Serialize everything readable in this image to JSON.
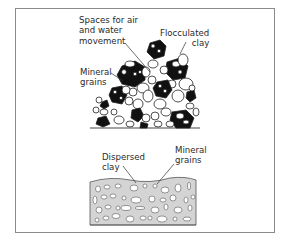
{
  "figure": {
    "flocculated": {
      "labels": {
        "spaces": "Spaces for air\nand water\nmovement",
        "flocculated_clay": "Flocculated\nclay",
        "mineral_grains": "Mineral\ngrains"
      }
    },
    "dispersed": {
      "labels": {
        "dispersed_clay": "Dispersed\nclay",
        "mineral_grains": "Mineral\ngrains"
      }
    },
    "colors": {
      "frame": "#8a8a8a",
      "clay_fill": "#111111",
      "grain_fill": "#ffffff",
      "dispersed_fill": "#d4d4d4",
      "line": "#333333"
    }
  }
}
